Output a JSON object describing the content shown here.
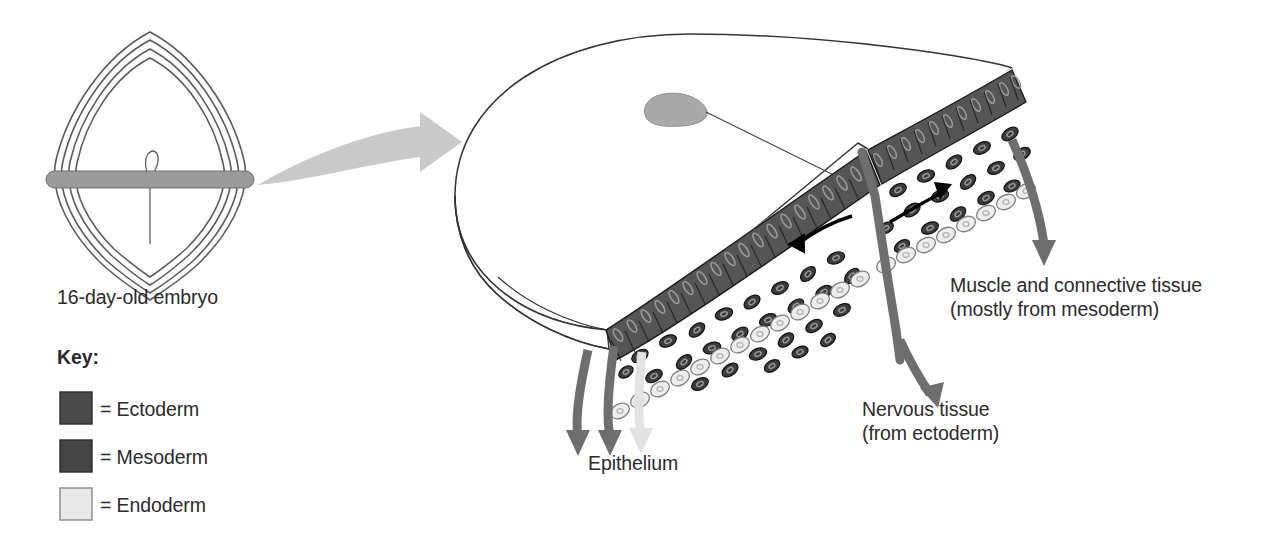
{
  "figure": {
    "type": "biology-diagram",
    "background_color": "#ffffff"
  },
  "left_panel": {
    "caption": "16-day-old embryo",
    "embryo": {
      "shape_name": "embryonic-disc-outline",
      "outline_count": 4,
      "outline_color": "#5b5b5b",
      "section_plane": {
        "name": "section-plane-band",
        "color": "#9a9a9a"
      },
      "primitive_node_loop": "primitive-node-loop",
      "primitive_streak_line": "primitive-streak-line"
    }
  },
  "transition_arrow": {
    "name": "magnify-arrow",
    "color": "#c9c9c9",
    "direction": "right"
  },
  "key": {
    "title": "Key:",
    "items": [
      {
        "label": "= Ectoderm",
        "color": "#4a4a4a",
        "border": "#2b2b2b"
      },
      {
        "label": "= Mesoderm",
        "color": "#454545",
        "border": "#2b2b2b"
      },
      {
        "label": "= Endoderm",
        "color": "#e9e9e9",
        "border": "#8a8a8a"
      }
    ]
  },
  "main_panel": {
    "disc": {
      "name": "embryonic-disc-3d",
      "outline_color": "#333333",
      "fill": "#ffffff"
    },
    "primitive_node": {
      "name": "primitive-node",
      "color": "#a9a9a9"
    },
    "primitive_streak": {
      "name": "primitive-streak",
      "color": "#444444"
    },
    "layers": [
      {
        "name": "ectoderm-layer",
        "cell_style": "columnar",
        "color": "#555555",
        "nucleus_color": "#8e8e8e"
      },
      {
        "name": "mesoderm-layer",
        "cell_style": "scattered-oval",
        "color": "#3c3c3c",
        "nucleus_color": "#8a8a8a"
      },
      {
        "name": "endoderm-layer",
        "cell_style": "single-row",
        "color": "#ededed",
        "nucleus_color": "#b5b5b5"
      }
    ],
    "migration_arrows": [
      {
        "name": "migration-arrow-left",
        "color": "#000000"
      },
      {
        "name": "migration-arrow-right",
        "color": "#000000"
      }
    ]
  },
  "callouts": [
    {
      "name": "callout-epithelium",
      "line1": "Epithelium",
      "line2": "",
      "arrow_colors": [
        "#6e6e6e",
        "#6e6e6e",
        "#e2e2e2"
      ],
      "arrow_count": 3
    },
    {
      "name": "callout-nervous-tissue",
      "line1": "Nervous tissue",
      "line2": "(from ectoderm)",
      "arrow_colors": [
        "#6e6e6e"
      ],
      "arrow_count": 1
    },
    {
      "name": "callout-muscle-connective",
      "line1": "Muscle and connective tissue",
      "line2": "(mostly from mesoderm)",
      "arrow_colors": [
        "#6e6e6e"
      ],
      "arrow_count": 1
    }
  ]
}
